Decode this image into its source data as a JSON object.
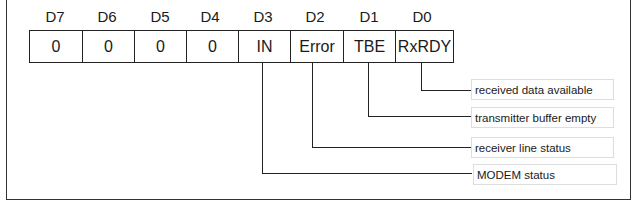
{
  "diagram": {
    "bits": [
      {
        "name": "D7",
        "value": "0"
      },
      {
        "name": "D6",
        "value": "0"
      },
      {
        "name": "D5",
        "value": "0"
      },
      {
        "name": "D4",
        "value": "0"
      },
      {
        "name": "D3",
        "value": "IN"
      },
      {
        "name": "D2",
        "value": "Error"
      },
      {
        "name": "D1",
        "value": "TBE"
      },
      {
        "name": "D0",
        "value": "RxRDY"
      }
    ],
    "descriptions": [
      {
        "bit": "D0",
        "text": "received data available"
      },
      {
        "bit": "D1",
        "text": "transmitter buffer empty"
      },
      {
        "bit": "D2",
        "text": "receiver line status"
      },
      {
        "bit": "D3",
        "text": "MODEM status"
      }
    ]
  }
}
